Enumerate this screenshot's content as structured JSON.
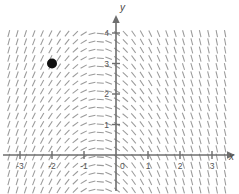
{
  "chart_data": {
    "type": "scatter",
    "title": "",
    "subtitle": "",
    "xlabel": "x",
    "ylabel": "y",
    "xlim": [
      -3.45,
      3.6
    ],
    "ylim": [
      -1.25,
      4.55
    ],
    "grid": false,
    "legend": null,
    "annotations": [],
    "x_ticks": [
      -3,
      -2,
      -1,
      0,
      1,
      2,
      3
    ],
    "x_tick_labels": [
      "-3",
      "-2",
      "-1",
      "0",
      "1",
      "2",
      "3"
    ],
    "y_ticks": [
      1,
      2,
      3,
      4
    ],
    "y_tick_labels": [
      "1",
      "2",
      "3",
      "4"
    ],
    "origin_label": "0",
    "points": [
      {
        "name": "initial-condition",
        "x": -2,
        "y": 3,
        "marker": "filled-circle",
        "radius_px": 5,
        "color": "#111111"
      }
    ],
    "slope_field": {
      "description": "short tick segments showing direction field",
      "color": "#9a9a9a",
      "segment_length_px": 7,
      "x_start": -3.35,
      "x_end": 3.45,
      "y_start": -1.15,
      "y_end": 4.15,
      "x_step": 0.26,
      "y_step": 0.27
    }
  },
  "axes": {
    "x_axis_name": "x-axis",
    "y_axis_name": "y-axis",
    "axis_color": "#6e6e6e",
    "arrow_x": "x",
    "arrow_y": "y"
  },
  "colors": {
    "background": "#ffffff",
    "axis": "#6e6e6e",
    "tick_text": "#555555",
    "slope_mark": "#9a9a9a",
    "point": "#111111"
  }
}
